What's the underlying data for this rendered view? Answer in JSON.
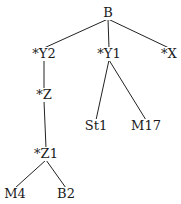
{
  "tree": {
    "nodes": [
      {
        "id": "B",
        "label": "B",
        "x": 108,
        "y": 13
      },
      {
        "id": "Y2",
        "label": "*Y2",
        "x": 44,
        "y": 54
      },
      {
        "id": "Y1",
        "label": "*Y1",
        "x": 109,
        "y": 54
      },
      {
        "id": "X",
        "label": "*X",
        "x": 169,
        "y": 54
      },
      {
        "id": "Z",
        "label": "*Z",
        "x": 44,
        "y": 95
      },
      {
        "id": "St1",
        "label": "St1",
        "x": 96,
        "y": 126
      },
      {
        "id": "M17",
        "label": "M17",
        "x": 146,
        "y": 126
      },
      {
        "id": "Z1",
        "label": "*Z1",
        "x": 46,
        "y": 154
      },
      {
        "id": "M4",
        "label": "M4",
        "x": 15,
        "y": 194
      },
      {
        "id": "B2",
        "label": "B2",
        "x": 66,
        "y": 194
      }
    ],
    "edges": [
      [
        "B",
        "Y2"
      ],
      [
        "B",
        "Y1"
      ],
      [
        "B",
        "X"
      ],
      [
        "Y2",
        "Z"
      ],
      [
        "Z",
        "Z1"
      ],
      [
        "Y1",
        "St1"
      ],
      [
        "Y1",
        "M17"
      ],
      [
        "Z1",
        "M4"
      ],
      [
        "Z1",
        "B2"
      ]
    ]
  }
}
